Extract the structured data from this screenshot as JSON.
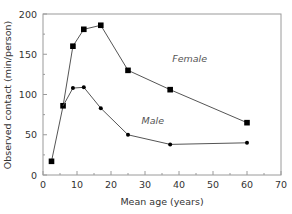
{
  "chart_data": {
    "type": "line",
    "title": "",
    "xlabel": "Mean age (years)",
    "ylabel": "Observed contact (min/person)",
    "xlim": [
      0,
      70
    ],
    "ylim": [
      0,
      200
    ],
    "xticks": [
      0,
      10,
      20,
      30,
      40,
      50,
      60,
      70
    ],
    "yticks": [
      0,
      50,
      100,
      150,
      200
    ],
    "grid": false,
    "legend": "inline labels",
    "series": [
      {
        "name": "Female",
        "marker": "square",
        "label_pos": [
          38,
          140
        ],
        "points": [
          [
            2.5,
            17
          ],
          [
            5.9,
            86
          ],
          [
            8.8,
            160
          ],
          [
            12,
            181
          ],
          [
            17,
            186
          ],
          [
            25,
            130
          ],
          [
            37.4,
            106
          ],
          [
            60,
            65
          ]
        ]
      },
      {
        "name": "Male",
        "marker": "circle",
        "label_pos": [
          29,
          63
        ],
        "points": [
          [
            5.9,
            86
          ],
          [
            8.8,
            108
          ],
          [
            12,
            109
          ],
          [
            17,
            83
          ],
          [
            25,
            50
          ],
          [
            37.4,
            38
          ],
          [
            60,
            40
          ]
        ]
      }
    ]
  },
  "colors": {
    "axis": "#9a9a9a",
    "line": "#555555",
    "marker": "#000000",
    "text": "#333333"
  }
}
